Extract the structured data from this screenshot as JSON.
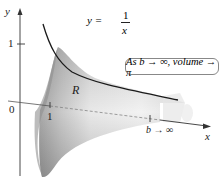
{
  "figure": {
    "type": "solid-of-revolution",
    "axes": {
      "x_label": "x",
      "y_label": "y",
      "origin_label": "0",
      "x_tick": "1",
      "y_tick": "1"
    },
    "curve": {
      "equation_lhs": "y =",
      "numerator": "1",
      "denominator": "x"
    },
    "region_label": "R",
    "limit_label": "b → ∞",
    "callout": "As b → ∞, volume → π",
    "colors": {
      "curve": "#1a1a1a",
      "solid_light": "#f2f2f2",
      "solid_dark": "#9a9a9a",
      "axis": "#333333"
    }
  }
}
